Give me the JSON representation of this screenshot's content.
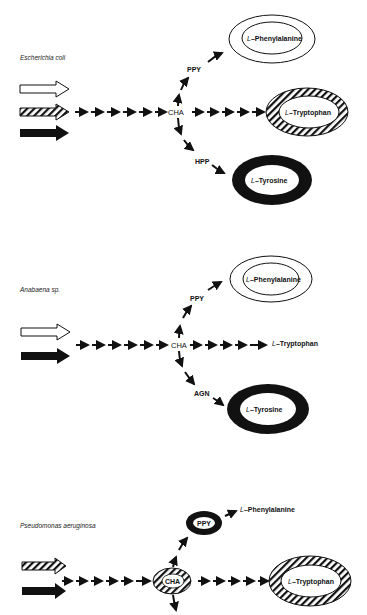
{
  "panels": [
    {
      "organism": "Escherichia coli",
      "input_arrows": [
        "open",
        "hatched",
        "solid"
      ],
      "branch_point": "CHA",
      "branches": [
        {
          "intermediate": "PPY",
          "product_prefix": "L",
          "product_name": "–Phenylalanine",
          "product_style": "open-double-ring"
        },
        {
          "intermediate": "",
          "product_prefix": "L",
          "product_name": "–Tryptophan",
          "product_style": "hatched-ring"
        },
        {
          "intermediate": "HPP",
          "product_prefix": "L",
          "product_name": "–Tyrosine",
          "product_style": "solid-ring"
        }
      ]
    },
    {
      "organism": "Anabaena sp.",
      "input_arrows": [
        "open",
        "solid"
      ],
      "branch_point": "CHA",
      "branches": [
        {
          "intermediate": "PPY",
          "product_prefix": "L",
          "product_name": "–Phenylalanine",
          "product_style": "open-double-ring"
        },
        {
          "intermediate": "",
          "product_prefix": "L",
          "product_name": "–Tryptophan",
          "product_style": "plain-text"
        },
        {
          "intermediate": "AGN",
          "product_prefix": "L",
          "product_name": "–Tyrosine",
          "product_style": "solid-ring"
        }
      ]
    },
    {
      "organism": "Pseudomonas aeruginosa",
      "input_arrows": [
        "hatched",
        "solid"
      ],
      "branch_point": "CHA",
      "branch_point_style": "hatched-ring",
      "branches": [
        {
          "intermediate": "PPY",
          "intermediate_style": "solid-ring",
          "product_prefix": "L",
          "product_name": "–Phenylalanine",
          "product_style": "plain-text"
        },
        {
          "intermediate": "",
          "product_prefix": "L",
          "product_name": "–Tryptophan",
          "product_style": "hatched-ring"
        }
      ]
    }
  ]
}
